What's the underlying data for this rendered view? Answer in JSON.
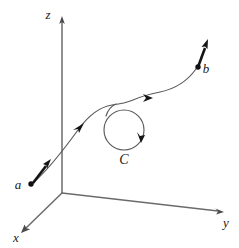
{
  "figure": {
    "canvas": {
      "width": 239,
      "height": 248,
      "background": "#ffffff"
    },
    "stroke_colors": {
      "axis": "#6b6b6b",
      "curve": "#5a5a5a",
      "tangent": "#151515",
      "label": "#1a1a1a"
    }
  },
  "axes": {
    "origin": {
      "x": 62,
      "y": 193
    },
    "items": [
      {
        "key": "z",
        "label": "z",
        "label_x": 48,
        "label_y": 19,
        "tip_x": 62,
        "tip_y": 18,
        "direction": "up"
      },
      {
        "key": "y",
        "label": "y",
        "label_x": 226,
        "label_y": 227,
        "tip_x": 222,
        "tip_y": 212,
        "direction": "right-down"
      },
      {
        "key": "x",
        "label": "x",
        "label_x": 16,
        "label_y": 242,
        "tip_x": 22,
        "tip_y": 231,
        "direction": "left-down"
      }
    ]
  },
  "points": [
    {
      "key": "a",
      "label": "a",
      "label_x": 18,
      "label_y": 189,
      "dot_x": 31,
      "dot_y": 184,
      "role": "start"
    },
    {
      "key": "b",
      "label": "b",
      "label_x": 204,
      "label_y": 72,
      "dot_x": 198,
      "dot_y": 67,
      "role": "end"
    }
  ],
  "loop": {
    "key": "C",
    "label": "C",
    "label_x": 119,
    "label_y": 163,
    "center_x": 124,
    "center_y": 130,
    "radius": 20,
    "orientation": "clockwise"
  },
  "curve": {
    "description": "smooth path from a to b passing over loop C",
    "direction_markers": 3
  }
}
